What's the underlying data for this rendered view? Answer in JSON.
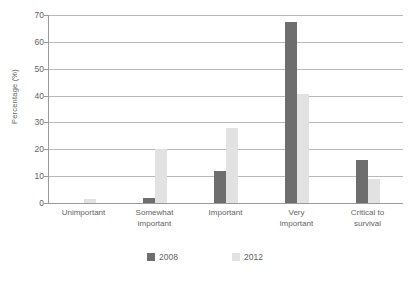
{
  "chart_data": {
    "type": "bar",
    "title": "",
    "subtitle": "",
    "xlabel": "",
    "ylabel": "Percentage (%)",
    "ylim": [
      0,
      70
    ],
    "ytick_step": 10,
    "yticks": [
      70,
      60,
      50,
      40,
      30,
      20,
      10,
      0
    ],
    "grid": "horizontal",
    "legend_position": "bottom-center",
    "categories": [
      "Unimportant",
      "Somewhat important",
      "Important",
      "Very important",
      "Critical to survival"
    ],
    "category_lines": [
      [
        "Unimportant"
      ],
      [
        "Somewhat",
        "important"
      ],
      [
        "Important"
      ],
      [
        "Very",
        "important"
      ],
      [
        "Critical to",
        "survival"
      ]
    ],
    "series": [
      {
        "name": "2008",
        "color": "#6e6e6e",
        "values": [
          0,
          2,
          12,
          67.5,
          16
        ]
      },
      {
        "name": "2012",
        "color": "#e2e2e2",
        "values": [
          1.5,
          20,
          28,
          40.5,
          9
        ]
      }
    ]
  },
  "legend": {
    "items": [
      {
        "label": "2008"
      },
      {
        "label": "2012"
      }
    ]
  },
  "colors": {
    "series_2008": "#6e6e6e",
    "series_2012": "#e2e2e2",
    "gridline": "#b9b9b9",
    "axis": "#9a9a9a",
    "text": "#636363",
    "background": "#ffffff"
  }
}
